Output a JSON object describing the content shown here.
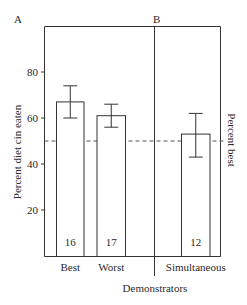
{
  "chart_data": {
    "type": "bar",
    "title": "",
    "panels": [
      {
        "label": "A",
        "categories": [
          "Best",
          "Worst"
        ]
      },
      {
        "label": "B",
        "categories": [
          "Simultaneous"
        ]
      }
    ],
    "categories": [
      "Best",
      "Worst",
      "Simultaneous"
    ],
    "values": [
      67,
      61,
      53
    ],
    "error_bars": [
      {
        "upper": 74,
        "lower": 60
      },
      {
        "upper": 66,
        "lower": 56
      },
      {
        "upper": 62,
        "lower": 43
      }
    ],
    "sample_sizes": [
      "16",
      "17",
      "12"
    ],
    "reference_line": {
      "value": 50,
      "style": "dashed",
      "label": "Percent best"
    },
    "xlabel": "Demonstrators",
    "ylabel": "Percent diet cin eaten",
    "right_label": "Percent best",
    "yticks": [
      20,
      40,
      60,
      80
    ],
    "ylim": [
      0,
      100
    ],
    "grid": false,
    "legend": null
  },
  "labels": {
    "panel_a": "A",
    "panel_b": "B",
    "xlabel": "Demonstrators",
    "ylabel": "Percent diet cin eaten",
    "right_label": "Percent best",
    "ticks": [
      "20",
      "40",
      "60",
      "80"
    ],
    "categories": [
      "Best",
      "Worst",
      "Simultaneous"
    ],
    "n": [
      "16",
      "17",
      "12"
    ]
  }
}
